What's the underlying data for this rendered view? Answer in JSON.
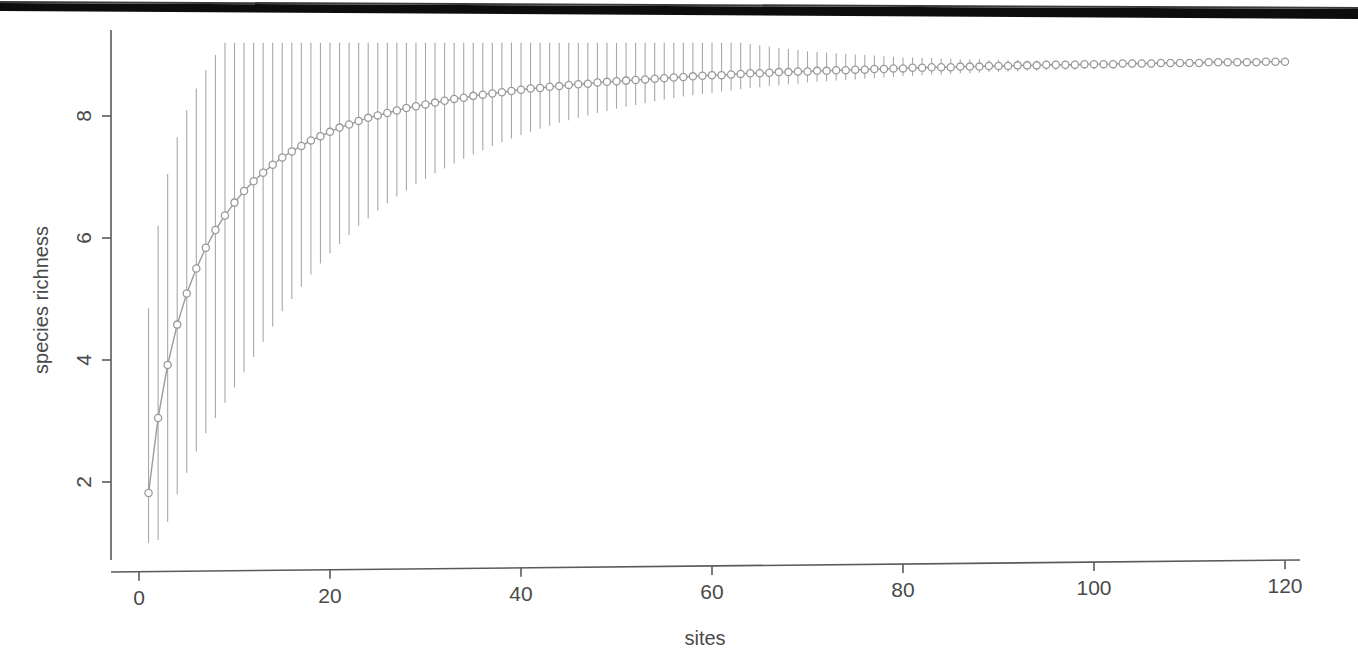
{
  "figure": {
    "background_color": "#ffffff",
    "scan_artifact": {
      "name": "top-black-scan-bar",
      "color": "#0d0d0d",
      "description": "black horizontal scanning band across top of page"
    },
    "axis_color": "#5a5a5a",
    "data_color": "#9a9a9a",
    "point_fill": "#ffffff",
    "errorbar_color": "#a8a8a8"
  },
  "chart_data": {
    "type": "line",
    "title": "",
    "subtitle": "",
    "xlabel": "sites",
    "ylabel": "species richness",
    "grid": false,
    "legend": "none",
    "xlim": [
      0,
      121
    ],
    "ylim": [
      1.0,
      9.2
    ],
    "xticks": [
      0,
      20,
      40,
      60,
      80,
      100,
      120
    ],
    "xtick_labels": [
      "0",
      "20",
      "40",
      "60",
      "80",
      "100",
      "120"
    ],
    "yticks": [
      2,
      4,
      6,
      8
    ],
    "ytick_labels": [
      "2",
      "4",
      "6",
      "8"
    ],
    "marker": "open-circle",
    "annotations": [],
    "series": [
      {
        "name": "rarefaction",
        "x": [
          1,
          2,
          3,
          4,
          5,
          6,
          7,
          8,
          9,
          10,
          11,
          12,
          13,
          14,
          15,
          16,
          17,
          18,
          19,
          20,
          21,
          22,
          23,
          24,
          25,
          26,
          27,
          28,
          29,
          30,
          31,
          32,
          33,
          34,
          35,
          36,
          37,
          38,
          39,
          40,
          41,
          42,
          43,
          44,
          45,
          46,
          47,
          48,
          49,
          50,
          51,
          52,
          53,
          54,
          55,
          56,
          57,
          58,
          59,
          60,
          61,
          62,
          63,
          64,
          65,
          66,
          67,
          68,
          69,
          70,
          71,
          72,
          73,
          74,
          75,
          76,
          77,
          78,
          79,
          80,
          81,
          82,
          83,
          84,
          85,
          86,
          87,
          88,
          89,
          90,
          91,
          92,
          93,
          94,
          95,
          96,
          97,
          98,
          99,
          100,
          101,
          102,
          103,
          104,
          105,
          106,
          107,
          108,
          109,
          110,
          111,
          112,
          113,
          114,
          115,
          116,
          117,
          118,
          119,
          120
        ],
        "y": [
          1.82,
          3.05,
          3.92,
          4.58,
          5.09,
          5.5,
          5.84,
          6.13,
          6.37,
          6.58,
          6.77,
          6.93,
          7.07,
          7.2,
          7.32,
          7.42,
          7.51,
          7.6,
          7.67,
          7.74,
          7.81,
          7.86,
          7.92,
          7.97,
          8.01,
          8.05,
          8.09,
          8.13,
          8.16,
          8.19,
          8.22,
          8.25,
          8.28,
          8.3,
          8.33,
          8.35,
          8.37,
          8.39,
          8.41,
          8.43,
          8.45,
          8.46,
          8.48,
          8.49,
          8.51,
          8.52,
          8.53,
          8.55,
          8.56,
          8.57,
          8.58,
          8.59,
          8.6,
          8.61,
          8.62,
          8.63,
          8.64,
          8.65,
          8.66,
          8.67,
          8.67,
          8.68,
          8.69,
          8.7,
          8.7,
          8.71,
          8.72,
          8.72,
          8.73,
          8.73,
          8.74,
          8.74,
          8.75,
          8.75,
          8.76,
          8.76,
          8.77,
          8.77,
          8.78,
          8.78,
          8.79,
          8.79,
          8.8,
          8.8,
          8.8,
          8.81,
          8.81,
          8.81,
          8.82,
          8.82,
          8.82,
          8.83,
          8.83,
          8.83,
          8.84,
          8.84,
          8.84,
          8.84,
          8.85,
          8.85,
          8.85,
          8.85,
          8.86,
          8.86,
          8.86,
          8.86,
          8.87,
          8.87,
          8.87,
          8.87,
          8.87,
          8.88,
          8.88,
          8.88,
          8.88,
          8.88,
          8.88,
          8.89,
          8.89,
          8.89
        ],
        "error_lower": [
          1.0,
          1.05,
          1.35,
          1.8,
          2.15,
          2.5,
          2.8,
          3.05,
          3.3,
          3.55,
          3.8,
          4.05,
          4.3,
          4.55,
          4.8,
          5.0,
          5.2,
          5.4,
          5.58,
          5.75,
          5.9,
          6.05,
          6.2,
          6.32,
          6.45,
          6.57,
          6.68,
          6.78,
          6.88,
          6.97,
          7.06,
          7.14,
          7.22,
          7.3,
          7.37,
          7.44,
          7.51,
          7.57,
          7.63,
          7.69,
          7.74,
          7.79,
          7.84,
          7.89,
          7.93,
          7.97,
          8.01,
          8.05,
          8.08,
          8.12,
          8.15,
          8.18,
          8.21,
          8.24,
          8.27,
          8.29,
          8.32,
          8.34,
          8.36,
          8.38,
          8.4,
          8.42,
          8.44,
          8.46,
          8.47,
          8.49,
          8.5,
          8.52,
          8.53,
          8.55,
          8.56,
          8.57,
          8.58,
          8.59,
          8.6,
          8.61,
          8.62,
          8.63,
          8.64,
          8.65,
          8.66,
          8.67,
          8.68,
          8.68,
          8.69,
          8.7,
          8.7,
          8.71,
          8.72,
          8.72,
          8.73,
          8.73,
          8.74,
          8.74,
          8.75,
          8.75,
          8.76,
          8.76,
          8.77,
          8.77,
          8.78,
          8.78,
          8.79,
          8.79,
          8.8,
          8.8,
          8.81,
          8.81,
          8.82,
          8.82,
          8.83,
          8.83,
          8.84,
          8.84,
          8.85,
          8.85,
          8.86,
          8.87,
          8.88,
          8.89
        ],
        "error_upper": [
          4.85,
          6.2,
          7.05,
          7.65,
          8.1,
          8.45,
          8.75,
          9.0,
          9.2,
          9.2,
          9.2,
          9.2,
          9.2,
          9.2,
          9.2,
          9.2,
          9.2,
          9.2,
          9.2,
          9.2,
          9.2,
          9.2,
          9.2,
          9.2,
          9.2,
          9.2,
          9.2,
          9.2,
          9.2,
          9.2,
          9.2,
          9.2,
          9.2,
          9.2,
          9.2,
          9.2,
          9.2,
          9.2,
          9.2,
          9.2,
          9.2,
          9.2,
          9.2,
          9.2,
          9.2,
          9.2,
          9.2,
          9.2,
          9.2,
          9.2,
          9.2,
          9.2,
          9.2,
          9.2,
          9.2,
          9.2,
          9.2,
          9.2,
          9.2,
          9.2,
          9.2,
          9.2,
          9.2,
          9.18,
          9.16,
          9.14,
          9.12,
          9.1,
          9.08,
          9.06,
          9.05,
          9.04,
          9.03,
          9.02,
          9.01,
          9.0,
          8.99,
          8.98,
          8.97,
          8.96,
          8.96,
          8.95,
          8.95,
          8.94,
          8.94,
          8.93,
          8.93,
          8.93,
          8.92,
          8.92,
          8.92,
          8.92,
          8.91,
          8.91,
          8.91,
          8.91,
          8.91,
          8.91,
          8.9,
          8.9,
          8.9,
          8.9,
          8.9,
          8.9,
          8.9,
          8.9,
          8.9,
          8.9,
          8.9,
          8.9,
          8.9,
          8.9,
          8.9,
          8.9,
          8.9,
          8.9,
          8.9,
          8.9,
          8.9,
          8.89
        ]
      }
    ]
  }
}
